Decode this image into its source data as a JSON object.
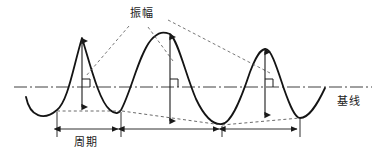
{
  "figure": {
    "type": "waveform-annotation-diagram",
    "background_color": "#ffffff",
    "stroke_color": "#1a1a1a",
    "labels": {
      "amplitude": "振幅",
      "baseline": "基线",
      "period": "周期"
    },
    "baseline": {
      "style": "dash-dot",
      "y": 87,
      "x_start": 14,
      "x_end": 372
    },
    "wave": {
      "style": "solid",
      "cycles": 3,
      "peaks": [
        {
          "x": 82,
          "y": 37
        },
        {
          "x": 170,
          "y": 33
        },
        {
          "x": 265,
          "y": 48
        }
      ],
      "troughs": [
        {
          "x": 57,
          "y": 110
        },
        {
          "x": 121,
          "y": 110
        },
        {
          "x": 222,
          "y": 124
        },
        {
          "x": 300,
          "y": 118
        }
      ]
    },
    "amplitude_arrows": [
      {
        "x": 82,
        "top_y": 38,
        "bottom_y": 110
      },
      {
        "x": 170,
        "top_y": 34,
        "bottom_y": 124
      },
      {
        "x": 265,
        "top_y": 49,
        "bottom_y": 118
      }
    ],
    "right_angle_markers": [
      {
        "x": 82,
        "y": 87
      },
      {
        "x": 170,
        "y": 87
      },
      {
        "x": 265,
        "y": 87
      }
    ],
    "period_spans": [
      {
        "x_start": 57,
        "x_end": 121
      },
      {
        "x_start": 123,
        "x_end": 222
      },
      {
        "x_start": 224,
        "x_end": 300
      }
    ],
    "leader_lines": [
      {
        "from_x": 129,
        "from_y": 26,
        "to_x": 86,
        "to_y": 75
      },
      {
        "from_x": 147,
        "from_y": 26,
        "to_x": 172,
        "to_y": 60
      },
      {
        "from_x": 168,
        "from_y": 21,
        "to_x": 268,
        "to_y": 72
      }
    ]
  }
}
